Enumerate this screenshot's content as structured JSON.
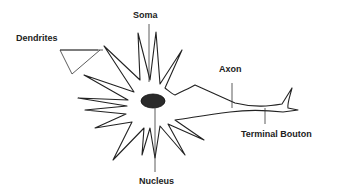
{
  "diagram": {
    "labels": {
      "soma": "Soma",
      "dendrites": "Dendrites",
      "axon": "Axon",
      "terminal_bouton": "Terminal Bouton",
      "nucleus": "Nucleus"
    },
    "colors": {
      "line": "#222222",
      "nucleus": "#2a2a2a",
      "background": "#ffffff"
    }
  }
}
